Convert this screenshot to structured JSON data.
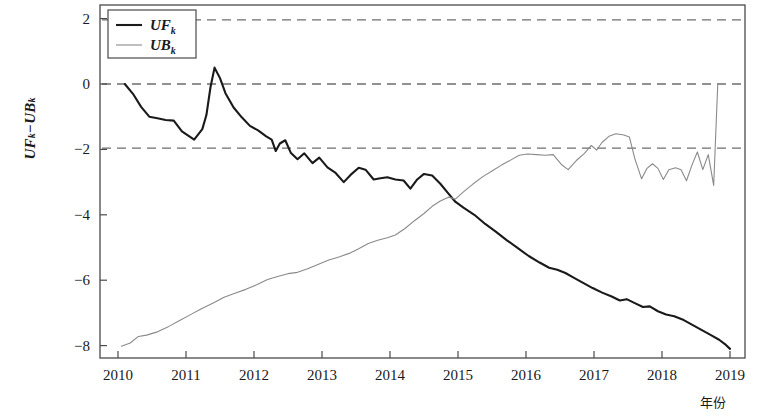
{
  "chart_data": {
    "type": "line",
    "title": "",
    "xlabel": "年份",
    "ylabel": "UF_k−UB_k",
    "ylabel_parts": {
      "uf": "UF",
      "uf_sub": "k",
      "minus": "−",
      "ub": "UB",
      "ub_sub": "k"
    },
    "xlim": [
      2009.5,
      2019.3
    ],
    "ylim": [
      -8.6,
      2.4
    ],
    "xticks": [
      2010,
      2011,
      2012,
      2013,
      2014,
      2015,
      2016,
      2017,
      2018,
      2019
    ],
    "xtick_labels": [
      "2010",
      "2011",
      "2012",
      "2013",
      "2014",
      "2015",
      "2016",
      "2017",
      "2018",
      "2019"
    ],
    "yticks": [
      2,
      0,
      -2,
      -4,
      -6,
      -8
    ],
    "ytick_labels": [
      "2",
      "0",
      "−2",
      "−4",
      "−6",
      "−8"
    ],
    "grid": false,
    "legend_position": "top-left",
    "reference_lines": [
      {
        "value": 1.96,
        "style": "dashed",
        "color": "#6e6e6e",
        "label": "+1.96"
      },
      {
        "value": 0,
        "style": "dashed",
        "color": "#6e6e6e",
        "label": "0"
      },
      {
        "value": -1.96,
        "style": "dashed",
        "color": "#6e6e6e",
        "label": "-1.96"
      }
    ],
    "series": [
      {
        "name": "UF_k",
        "legend_label": "UF",
        "legend_sub": "k",
        "color": "#1a1a1a",
        "width": 2.1,
        "points": [
          [
            2010.1,
            0.0
          ],
          [
            2010.22,
            -0.3
          ],
          [
            2010.34,
            -0.7
          ],
          [
            2010.46,
            -1.0
          ],
          [
            2010.58,
            -1.05
          ],
          [
            2010.7,
            -1.1
          ],
          [
            2010.82,
            -1.12
          ],
          [
            2010.94,
            -1.45
          ],
          [
            2011.06,
            -1.62
          ],
          [
            2011.12,
            -1.7
          ],
          [
            2011.24,
            -1.38
          ],
          [
            2011.3,
            -0.95
          ],
          [
            2011.36,
            -0.1
          ],
          [
            2011.42,
            0.5
          ],
          [
            2011.5,
            0.18
          ],
          [
            2011.58,
            -0.28
          ],
          [
            2011.7,
            -0.72
          ],
          [
            2011.82,
            -1.02
          ],
          [
            2011.94,
            -1.28
          ],
          [
            2012.06,
            -1.42
          ],
          [
            2012.18,
            -1.6
          ],
          [
            2012.26,
            -1.7
          ],
          [
            2012.32,
            -2.05
          ],
          [
            2012.38,
            -1.82
          ],
          [
            2012.46,
            -1.72
          ],
          [
            2012.54,
            -2.1
          ],
          [
            2012.64,
            -2.3
          ],
          [
            2012.74,
            -2.12
          ],
          [
            2012.86,
            -2.42
          ],
          [
            2012.96,
            -2.25
          ],
          [
            2013.08,
            -2.55
          ],
          [
            2013.2,
            -2.72
          ],
          [
            2013.32,
            -3.0
          ],
          [
            2013.42,
            -2.78
          ],
          [
            2013.54,
            -2.56
          ],
          [
            2013.64,
            -2.62
          ],
          [
            2013.76,
            -2.92
          ],
          [
            2013.86,
            -2.88
          ],
          [
            2013.96,
            -2.85
          ],
          [
            2014.08,
            -2.92
          ],
          [
            2014.2,
            -2.95
          ],
          [
            2014.3,
            -3.2
          ],
          [
            2014.4,
            -2.92
          ],
          [
            2014.5,
            -2.75
          ],
          [
            2014.62,
            -2.8
          ],
          [
            2014.74,
            -3.05
          ],
          [
            2014.86,
            -3.35
          ],
          [
            2014.96,
            -3.6
          ],
          [
            2015.08,
            -3.78
          ],
          [
            2015.24,
            -4.0
          ],
          [
            2015.4,
            -4.28
          ],
          [
            2015.56,
            -4.52
          ],
          [
            2015.72,
            -4.78
          ],
          [
            2015.88,
            -5.02
          ],
          [
            2016.04,
            -5.26
          ],
          [
            2016.2,
            -5.46
          ],
          [
            2016.34,
            -5.62
          ],
          [
            2016.46,
            -5.68
          ],
          [
            2016.58,
            -5.78
          ],
          [
            2016.7,
            -5.92
          ],
          [
            2016.84,
            -6.08
          ],
          [
            2016.98,
            -6.24
          ],
          [
            2017.12,
            -6.38
          ],
          [
            2017.26,
            -6.5
          ],
          [
            2017.38,
            -6.62
          ],
          [
            2017.48,
            -6.58
          ],
          [
            2017.6,
            -6.7
          ],
          [
            2017.72,
            -6.82
          ],
          [
            2017.82,
            -6.8
          ],
          [
            2017.94,
            -6.95
          ],
          [
            2018.06,
            -7.05
          ],
          [
            2018.18,
            -7.1
          ],
          [
            2018.32,
            -7.22
          ],
          [
            2018.46,
            -7.38
          ],
          [
            2018.58,
            -7.52
          ],
          [
            2018.72,
            -7.68
          ],
          [
            2018.84,
            -7.82
          ],
          [
            2018.94,
            -7.98
          ],
          [
            2019.0,
            -8.1
          ]
        ]
      },
      {
        "name": "UB_k",
        "legend_label": "UB",
        "legend_sub": "k",
        "color": "#8a8a8a",
        "width": 1.1,
        "points": [
          [
            2010.05,
            -8.02
          ],
          [
            2010.18,
            -7.92
          ],
          [
            2010.3,
            -7.72
          ],
          [
            2010.42,
            -7.68
          ],
          [
            2010.58,
            -7.58
          ],
          [
            2010.74,
            -7.42
          ],
          [
            2010.9,
            -7.24
          ],
          [
            2011.06,
            -7.06
          ],
          [
            2011.22,
            -6.88
          ],
          [
            2011.4,
            -6.7
          ],
          [
            2011.56,
            -6.52
          ],
          [
            2011.72,
            -6.4
          ],
          [
            2011.88,
            -6.28
          ],
          [
            2012.04,
            -6.14
          ],
          [
            2012.2,
            -5.98
          ],
          [
            2012.36,
            -5.88
          ],
          [
            2012.5,
            -5.8
          ],
          [
            2012.64,
            -5.76
          ],
          [
            2012.78,
            -5.66
          ],
          [
            2012.94,
            -5.52
          ],
          [
            2013.1,
            -5.38
          ],
          [
            2013.26,
            -5.28
          ],
          [
            2013.4,
            -5.18
          ],
          [
            2013.54,
            -5.04
          ],
          [
            2013.68,
            -4.88
          ],
          [
            2013.82,
            -4.78
          ],
          [
            2013.96,
            -4.7
          ],
          [
            2014.08,
            -4.62
          ],
          [
            2014.22,
            -4.42
          ],
          [
            2014.36,
            -4.18
          ],
          [
            2014.5,
            -3.96
          ],
          [
            2014.62,
            -3.74
          ],
          [
            2014.74,
            -3.58
          ],
          [
            2014.86,
            -3.46
          ],
          [
            2014.96,
            -3.52
          ],
          [
            2015.08,
            -3.3
          ],
          [
            2015.22,
            -3.06
          ],
          [
            2015.36,
            -2.84
          ],
          [
            2015.5,
            -2.66
          ],
          [
            2015.64,
            -2.48
          ],
          [
            2015.78,
            -2.32
          ],
          [
            2015.9,
            -2.18
          ],
          [
            2016.02,
            -2.14
          ],
          [
            2016.16,
            -2.16
          ],
          [
            2016.28,
            -2.18
          ],
          [
            2016.4,
            -2.16
          ],
          [
            2016.52,
            -2.46
          ],
          [
            2016.62,
            -2.62
          ],
          [
            2016.74,
            -2.34
          ],
          [
            2016.86,
            -2.12
          ],
          [
            2016.96,
            -1.88
          ],
          [
            2017.04,
            -2.02
          ],
          [
            2017.12,
            -1.78
          ],
          [
            2017.22,
            -1.6
          ],
          [
            2017.32,
            -1.52
          ],
          [
            2017.44,
            -1.56
          ],
          [
            2017.52,
            -1.62
          ],
          [
            2017.6,
            -2.28
          ],
          [
            2017.7,
            -2.9
          ],
          [
            2017.78,
            -2.58
          ],
          [
            2017.86,
            -2.44
          ],
          [
            2017.94,
            -2.58
          ],
          [
            2018.02,
            -2.92
          ],
          [
            2018.1,
            -2.62
          ],
          [
            2018.2,
            -2.56
          ],
          [
            2018.28,
            -2.62
          ],
          [
            2018.36,
            -2.96
          ],
          [
            2018.44,
            -2.48
          ],
          [
            2018.52,
            -2.08
          ],
          [
            2018.6,
            -2.62
          ],
          [
            2018.68,
            -2.16
          ],
          [
            2018.76,
            -3.1
          ],
          [
            2018.82,
            0.0
          ]
        ]
      }
    ]
  },
  "legend": {
    "entries": [
      {
        "label": "UF",
        "sub": "k",
        "color": "#1a1a1a",
        "width": 2.1
      },
      {
        "label": "UB",
        "sub": "k",
        "color": "#8a8a8a",
        "width": 1.1
      }
    ]
  },
  "axes": {
    "y_label_uf": "UF",
    "y_label_sub1": "k",
    "y_label_minus": "−",
    "y_label_ub": "UB",
    "y_label_sub2": "k",
    "x_axis_caption": "年份"
  }
}
